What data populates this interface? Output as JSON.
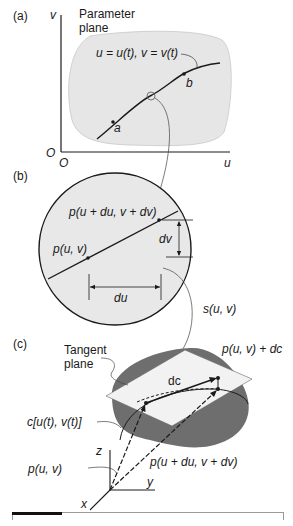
{
  "panels": {
    "a": {
      "label": "(a)",
      "title_line1": "Parameter",
      "title_line2": "plane",
      "axis_v": "v",
      "axis_u": "u",
      "origin_left": "O",
      "origin_bottom": "O",
      "curve_eq_u": "u",
      "curve_eq": "u = u(t), v = v(t)",
      "point_a": "a",
      "point_b": "b"
    },
    "b": {
      "label": "(b)",
      "point_p": "p(u, v)",
      "point_pd": "p(u + du, v + dv)",
      "dv": "dv",
      "du": "du",
      "surface": "s(u, v)"
    },
    "c": {
      "label": "(c)",
      "tangent_line1": "Tangent",
      "tangent_line2": "plane",
      "dc": "dc",
      "p_plus_dc": "p(u, v) + dc",
      "curve_c": "c[u(t), v(t)]",
      "p_uv": "p(u, v)",
      "p_uduvdv": "p(u + du, v + dv)",
      "axis_x": "x",
      "axis_y": "y",
      "axis_z": "z"
    }
  },
  "colors": {
    "region_fill": "#e6e6e6",
    "surface_fill": "#6e6e6e",
    "tangent_fill": "#f2f2f2",
    "ink": "#1a1a1a"
  }
}
